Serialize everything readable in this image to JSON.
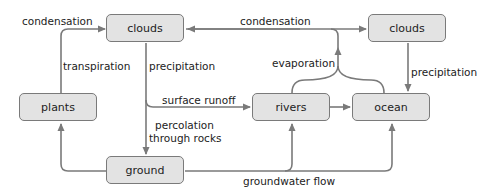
{
  "diagram": {
    "nodes": {
      "clouds_left": "clouds",
      "clouds_right": "clouds",
      "plants": "plants",
      "ground": "ground",
      "rivers": "rivers",
      "ocean": "ocean"
    },
    "edges": {
      "condensation_left": "condensation",
      "condensation_top": "condensation",
      "transpiration": "transpiration",
      "precipitation_left": "precipitation",
      "precipitation_right": "precipitation",
      "evaporation": "evaporation",
      "surface_runoff": "surface runoff",
      "percolation_1": "percolation",
      "percolation_2": "through rocks",
      "groundwater_flow": "groundwater flow"
    },
    "colors": {
      "box_fill": "#e3e3e3",
      "box_border": "#7a7a7a",
      "arrow": "#7a7a7a"
    }
  }
}
